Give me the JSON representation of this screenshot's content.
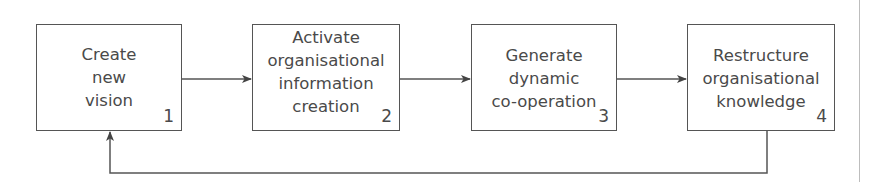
{
  "diagram": {
    "type": "flowchart",
    "direction": "left-to-right with feedback loop",
    "colors": {
      "line": "#555555",
      "text": "#4a4a4a",
      "right_rule": "#bdbdbd"
    },
    "nodes": [
      {
        "id": "1",
        "number": "1",
        "lines": [
          "Create",
          "new",
          "vision"
        ]
      },
      {
        "id": "2",
        "number": "2",
        "lines": [
          "Activate",
          "organisational",
          "information",
          "creation"
        ]
      },
      {
        "id": "3",
        "number": "3",
        "lines": [
          "Generate",
          "dynamic",
          "co-operation"
        ]
      },
      {
        "id": "4",
        "number": "4",
        "lines": [
          "Restructure",
          "organisational",
          "knowledge"
        ]
      }
    ],
    "edges": [
      {
        "from": "1",
        "to": "2"
      },
      {
        "from": "2",
        "to": "3"
      },
      {
        "from": "3",
        "to": "4"
      },
      {
        "from": "4",
        "to": "1",
        "kind": "feedback"
      }
    ]
  }
}
